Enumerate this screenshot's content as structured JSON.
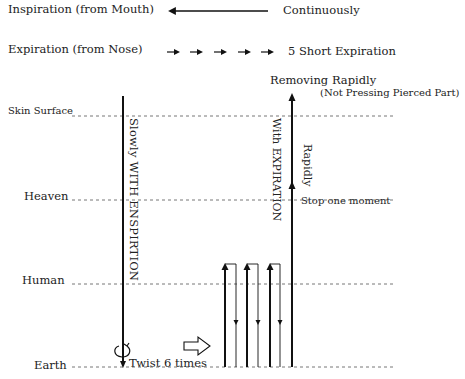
{
  "legend": {
    "inspiration": {
      "label": "Inspiration (from Mouth)",
      "arrow": "long-left-arrow",
      "description": "Continuously"
    },
    "expiration": {
      "label": "Expiration (from Nose)",
      "arrow": "five-short-right-arrows",
      "description": "5 Short Expiration"
    }
  },
  "levels": [
    {
      "name": "Skin Surface"
    },
    {
      "name": "Heaven"
    },
    {
      "name": "Human"
    },
    {
      "name": "Earth"
    }
  ],
  "insertion": {
    "label": "Slowly WITH ENSPIRTION",
    "twist": "Twist 6 times"
  },
  "withdrawal": {
    "expiration_label": "With EXPIRATION",
    "rapid_label": "Rapidly",
    "stop_label": "Stop one moment",
    "remove_title": "Removing Rapidly",
    "remove_note": "(Not Pressing Pierced Part)"
  },
  "colors": {
    "line": "#111111",
    "dashed": "#666666",
    "text": "#222222"
  }
}
